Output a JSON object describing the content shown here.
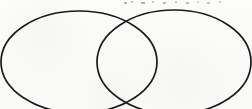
{
  "figure": {
    "caption": "",
    "width": 252,
    "height": 109,
    "background_color": "#fbfbfa",
    "stroke_color": "#1a1a1a",
    "stroke_width": 1.7,
    "fill": "none",
    "cropped_note": "Bottoms of both ellipses run off the bottom edge of the image"
  },
  "shapes": [
    {
      "name": "left-ellipse",
      "type": "ellipse",
      "cx": 79,
      "cy": 62,
      "rx": 78,
      "ry": 51,
      "stroke": "#1a1a1a",
      "stroke_width": 1.7
    },
    {
      "name": "right-ellipse",
      "type": "ellipse",
      "cx": 174,
      "cy": 62,
      "rx": 77,
      "ry": 52,
      "stroke": "#1a1a1a",
      "stroke_width": 1.7
    }
  ],
  "intersections": [
    {
      "name": "top-crossing",
      "x": 127,
      "y": 13
    },
    {
      "name": "bottom-crossing",
      "x": 126,
      "y": 103
    }
  ],
  "regions": [
    {
      "name": "left-only-region",
      "label": ""
    },
    {
      "name": "overlap-region",
      "label": ""
    },
    {
      "name": "right-only-region",
      "label": ""
    }
  ],
  "artifacts": {
    "top_specks": [
      {
        "x": 124,
        "y": 2,
        "w": 3,
        "h": 2,
        "opacity": 0.32
      },
      {
        "x": 131,
        "y": 1,
        "w": 2,
        "h": 2,
        "opacity": 0.26
      },
      {
        "x": 141,
        "y": 2,
        "w": 4,
        "h": 2,
        "opacity": 0.34
      },
      {
        "x": 152,
        "y": 1,
        "w": 2,
        "h": 2,
        "opacity": 0.22
      },
      {
        "x": 163,
        "y": 2,
        "w": 3,
        "h": 2,
        "opacity": 0.3
      },
      {
        "x": 175,
        "y": 1,
        "w": 2,
        "h": 2,
        "opacity": 0.24
      },
      {
        "x": 186,
        "y": 2,
        "w": 3,
        "h": 2,
        "opacity": 0.28
      },
      {
        "x": 197,
        "y": 1,
        "w": 2,
        "h": 2,
        "opacity": 0.2
      },
      {
        "x": 207,
        "y": 2,
        "w": 3,
        "h": 2,
        "opacity": 0.26
      },
      {
        "x": 219,
        "y": 1,
        "w": 2,
        "h": 2,
        "opacity": 0.22
      }
    ]
  }
}
